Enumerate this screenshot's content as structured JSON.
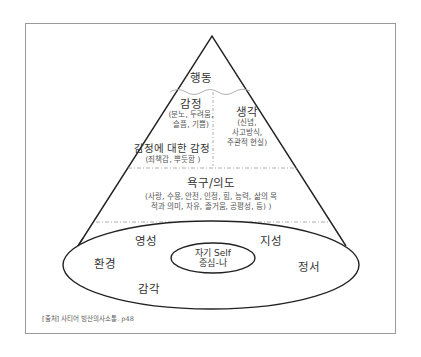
{
  "diagram": {
    "type": "satir-iceberg",
    "apex": {
      "label": "행동"
    },
    "feelings": {
      "label": "감정",
      "detail_line1": "(분노, 두려움,",
      "detail_line2": "슬픔, 기쁨)"
    },
    "thoughts": {
      "label": "생각",
      "detail_line1": "(신념,",
      "detail_line2": "사고방식,",
      "detail_line3": "주관적 현실)"
    },
    "feelings_about_feelings": {
      "label": "감정에 대한 감정",
      "detail": "(죄책감, 뿌듯함 )"
    },
    "yearnings": {
      "label": "욕구/의도",
      "detail_line1": "(사랑, 수용, 안전, 인정, 힘, 능력, 삶의 목",
      "detail_line2": "적과 의미, 자유, 즐거움, 공평성, 등) )"
    },
    "base_ellipse": {
      "labels": {
        "top_left": "영성",
        "top_right": "지성",
        "left": "환경",
        "right": "정서",
        "bottom": "감각"
      }
    },
    "core": {
      "line1": "자기 Self",
      "line2": "중심-나"
    },
    "source": "[출처] 사티어 빙산의사소통. p48",
    "colors": {
      "stroke": "#222222",
      "divider": "#888888",
      "frame": "#9a9a9a",
      "text": "#333333"
    }
  }
}
